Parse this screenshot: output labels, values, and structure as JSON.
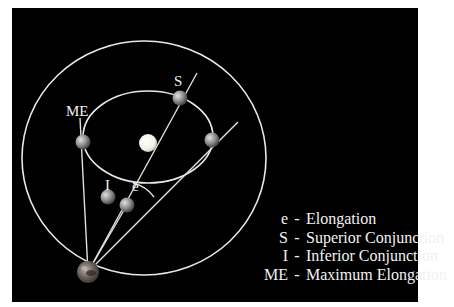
{
  "diagram": {
    "labels": {
      "superior_conjunction": "S",
      "maximum_elongation": "ME",
      "inferior_conjunction": "I",
      "elongation_angle": "e"
    },
    "bodies": {
      "sun": "Sun",
      "earth": "Earth",
      "planet_superior": "Planet at superior conjunction",
      "planet_max_elongation": "Planet at maximum elongation",
      "planet_inferior": "Planet at inferior conjunction",
      "planet_elongation": "Planet at elongation",
      "planet_right": "Planet on inner orbit"
    },
    "orbits": {
      "inner": "Inner planet orbit",
      "outer": "Earth orbit"
    }
  },
  "legend": {
    "items": [
      {
        "key": "e",
        "sep": "-",
        "text": "Elongation"
      },
      {
        "key": "S",
        "sep": "-",
        "text": "Superior Conjunction"
      },
      {
        "key": "I",
        "sep": "-",
        "text": "Inferior Conjunction"
      },
      {
        "key": "ME",
        "sep": "-",
        "text": "Maximum Elongation"
      }
    ]
  },
  "colors": {
    "background": "#000000",
    "line": "#e8e8e8",
    "text": "#f2f2f2",
    "sun": "#f5f5f0",
    "planet": "#9a9a9a",
    "earth": "#7a6e66"
  }
}
